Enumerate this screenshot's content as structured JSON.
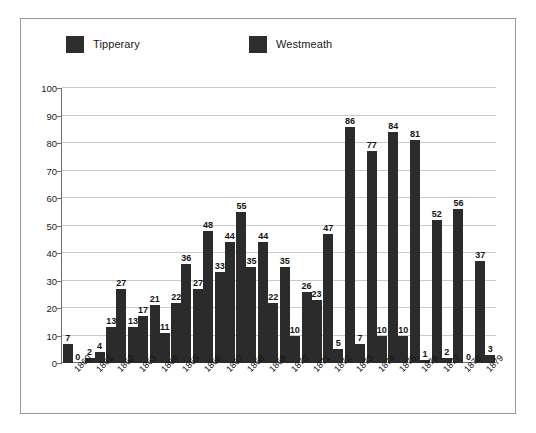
{
  "chart_data": {
    "type": "bar",
    "title": "",
    "xlabel": "",
    "ylabel": "",
    "ylim": [
      0,
      100
    ],
    "ytick_step": 10,
    "yticks": [
      0,
      10,
      20,
      30,
      40,
      50,
      60,
      70,
      80,
      90,
      100
    ],
    "grid": true,
    "legend_position": "top",
    "categories": [
      "1860",
      "1861",
      "1862",
      "1863",
      "1864",
      "1865",
      "1866",
      "1867",
      "1868",
      "1869",
      "1870",
      "1871",
      "1872",
      "1873",
      "1874",
      "1875",
      "1876",
      "1877",
      "1878",
      "1879"
    ],
    "series": [
      {
        "name": "Tipperary",
        "color": "#2b2b2b",
        "values": [
          7,
          2,
          13,
          13,
          21,
          22,
          27,
          33,
          55,
          44,
          35,
          26,
          47,
          86,
          77,
          84,
          81,
          52,
          56,
          37
        ]
      },
      {
        "name": "Westmeath",
        "color": "#2b2b2b",
        "values": [
          0,
          4,
          27,
          17,
          11,
          36,
          48,
          44,
          35,
          22,
          10,
          23,
          5,
          7,
          10,
          10,
          1,
          2,
          0,
          3
        ]
      }
    ]
  },
  "legend": {
    "entries": [
      {
        "label": "Tipperary",
        "color": "#2b2b2b"
      },
      {
        "label": "Westmeath",
        "color": "#2b2b2b"
      }
    ]
  },
  "axes": {
    "y_labels": [
      "100",
      "90",
      "80",
      "70",
      "60",
      "50",
      "40",
      "30",
      "20",
      "10",
      "0"
    ],
    "x_labels": [
      "1860",
      "1861",
      "1862",
      "1863",
      "1864",
      "1865",
      "1866",
      "1867",
      "1868",
      "1869",
      "1870",
      "1871",
      "1872",
      "1873",
      "1874",
      "1875",
      "1876",
      "1877",
      "1878",
      "1879"
    ]
  },
  "colors": {
    "bar": "#2b2b2b",
    "grid": "#c9c9c9",
    "axis": "#6e6e6e",
    "frame": "#9a9a9a",
    "background": "#ffffff",
    "text": "#141414"
  }
}
